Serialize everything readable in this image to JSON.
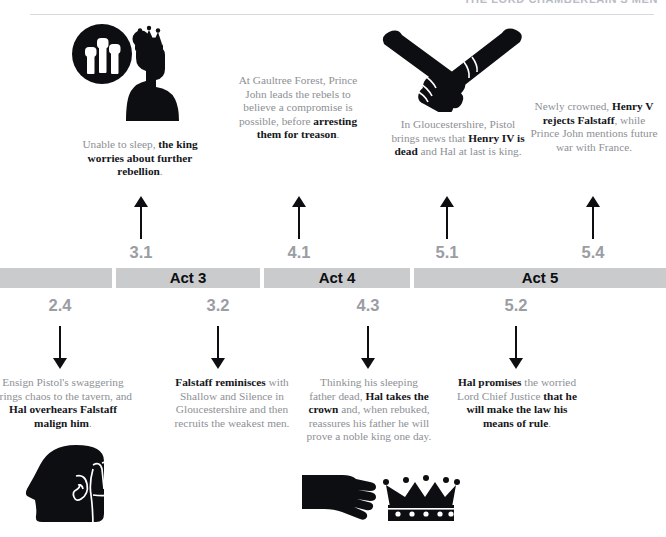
{
  "header": {
    "title": "THE LORD CHAMBERLAIN'S MEN"
  },
  "timeline": {
    "segments": [
      {
        "label": "",
        "scene_above": "",
        "scene_below": "2.4"
      },
      {
        "label": "Act 3",
        "scene_above": "3.1",
        "scene_below": "3.2"
      },
      {
        "label": "Act 4",
        "scene_above": "4.1",
        "scene_below": "4.3"
      },
      {
        "label": "Act 5",
        "scene_above": "5.1",
        "scene_below": "5.2"
      }
    ],
    "extra_scene_above": "5.4",
    "bar_color": "#c9cbcd",
    "accent_color": "#0d0e11",
    "muted_color": "#8d9096"
  },
  "above": {
    "scene_numbers": [
      "3.1",
      "4.1",
      "5.1",
      "5.4"
    ],
    "items": [
      {
        "id": "king-worries",
        "icon": "king-thought-bubble-fists-icon",
        "text_runs": [
          {
            "t": "Unable to sleep, ",
            "b": false
          },
          {
            "t": "the king worries about further rebellion",
            "b": true
          },
          {
            "t": ".",
            "b": false
          }
        ]
      },
      {
        "id": "gaultree-forest",
        "icon": "",
        "text_runs": [
          {
            "t": "At Gaultree Forest, Prince John leads the rebels to believe a compromise is possible, before ",
            "b": false
          },
          {
            "t": "arresting them for treason",
            "b": true
          },
          {
            "t": ".",
            "b": false
          }
        ]
      },
      {
        "id": "pistol-news",
        "icon": "handshake-icon",
        "text_runs": [
          {
            "t": "In Gloucestershire, Pistol brings news that ",
            "b": false
          },
          {
            "t": "Henry IV is dead",
            "b": true
          },
          {
            "t": " and Hal at last is king.",
            "b": false
          }
        ]
      },
      {
        "id": "henry-v-rejects-falstaff",
        "icon": "",
        "text_runs": [
          {
            "t": "Newly crowned, ",
            "b": false
          },
          {
            "t": "Henry V rejects Falstaff",
            "b": true
          },
          {
            "t": ", while Prince John mentions future war with France.",
            "b": false
          }
        ]
      }
    ]
  },
  "below": {
    "scene_numbers": [
      "2.4",
      "3.2",
      "4.3",
      "5.2"
    ],
    "items": [
      {
        "id": "ensign-pistol",
        "icon": "eavesdropping-head-icon",
        "text_runs": [
          {
            "t": "Ensign Pistol's swaggering brings chaos to the tavern, and ",
            "b": false
          },
          {
            "t": "Hal overhears Falstaff malign him",
            "b": true
          },
          {
            "t": ".",
            "b": false
          }
        ]
      },
      {
        "id": "falstaff-reminisces",
        "icon": "",
        "text_runs": [
          {
            "t": "Falstaff reminisces",
            "b": true
          },
          {
            "t": " with Shallow and Silence in Gloucestershire and then recruits the weakest men.",
            "b": false
          }
        ]
      },
      {
        "id": "hal-takes-crown",
        "icon": "hand-reaching-crown-icon",
        "text_runs": [
          {
            "t": "Thinking his sleeping father dead, ",
            "b": false
          },
          {
            "t": "Hal takes the crown",
            "b": true
          },
          {
            "t": " and, when rebuked, reassures his father he will prove a noble king one day.",
            "b": false
          }
        ]
      },
      {
        "id": "hal-promises",
        "icon": "",
        "text_runs": [
          {
            "t": "Hal promises",
            "b": true
          },
          {
            "t": " the worried Lord Chief Justice ",
            "b": false
          },
          {
            "t": "that he will make the law his means of rule",
            "b": true
          },
          {
            "t": ".",
            "b": false
          }
        ]
      }
    ]
  }
}
